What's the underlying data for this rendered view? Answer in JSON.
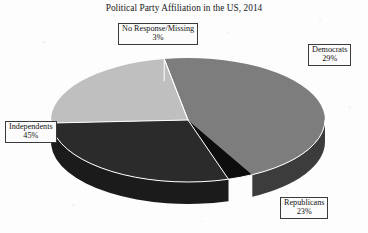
{
  "chart_data": {
    "type": "pie",
    "title": "Political Party Affiliation in the US, 2014",
    "xlabel": "",
    "ylabel": "",
    "legend_position": "none",
    "grid": false,
    "three_d": true,
    "categories": [
      "No Response/Missing",
      "Democrats",
      "Republicans",
      "Independents"
    ],
    "values": [
      3,
      29,
      23,
      45
    ],
    "value_suffix": "%",
    "slices": [
      {
        "label": "No Response/Missing",
        "value": 3,
        "value_text": "3%",
        "color": "#0d0d0d",
        "side_color": "#070707"
      },
      {
        "label": "Democrats",
        "value": 29,
        "value_text": "29%",
        "color": "#2b2b2b",
        "side_color": "#1b1b1b"
      },
      {
        "label": "Republicans",
        "value": 23,
        "value_text": "23%",
        "color": "#bfbfbf",
        "side_color": "#4a4a4a"
      },
      {
        "label": "Independents",
        "value": 45,
        "value_text": "45%",
        "color": "#7d7d7d",
        "side_color": "#3c3c3c"
      }
    ],
    "annotations": [
      "No Response/Missing 3%",
      "Democrats 29%",
      "Republicans 23%",
      "Independents 45%"
    ]
  },
  "title": "Political Party Affiliation in the US, 2014",
  "callouts": {
    "no_response": {
      "label": "No Response/Missing",
      "value": "3%"
    },
    "democrats": {
      "label": "Democrats",
      "value": "29%"
    },
    "independents": {
      "label": "Independents",
      "value": "45%"
    },
    "republicans": {
      "label": "Republicans",
      "value": "23%"
    }
  },
  "colors": {
    "background": "#fdfdfd",
    "text": "#131313",
    "divider": "#ffffff",
    "callout_border": "#3a3a3a"
  }
}
